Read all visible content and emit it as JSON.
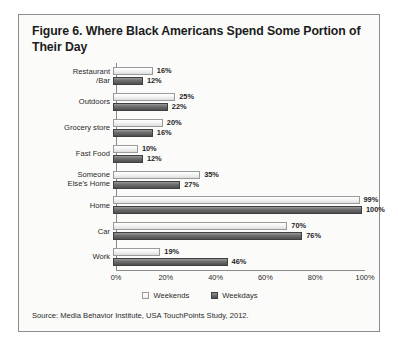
{
  "figure": {
    "title": "Figure 6. Where Black Americans Spend Some Portion of Their Day",
    "source": "Source: Media Behavior Institute, USA TouchPoints Study, 2012."
  },
  "chart_data": {
    "type": "bar",
    "orientation": "horizontal",
    "title": "Figure 6. Where Black Americans Spend Some Portion of Their Day",
    "xlabel": "",
    "ylabel": "",
    "xlim": [
      0,
      100
    ],
    "xticks": [
      "0%",
      "20%",
      "40%",
      "60%",
      "80%",
      "100%"
    ],
    "xtick_values": [
      0,
      20,
      40,
      60,
      80,
      100
    ],
    "grid": false,
    "legend_position": "bottom",
    "categories": [
      "Restaurant\n/Bar",
      "Outdoors",
      "Grocery store",
      "Fast Food",
      "Someone\nElse's Home",
      "Home",
      "Car",
      "Work"
    ],
    "series": [
      {
        "name": "Weekends",
        "color": "#f4f4f4",
        "values": [
          16,
          25,
          20,
          10,
          35,
          99,
          70,
          19
        ],
        "labels": [
          "16%",
          "25%",
          "20%",
          "10%",
          "35%",
          "99%",
          "70%",
          "19%"
        ]
      },
      {
        "name": "Weekdays",
        "color": "#5e5e5e",
        "values": [
          12,
          22,
          16,
          12,
          27,
          100,
          76,
          46
        ],
        "labels": [
          "12%",
          "22%",
          "16%",
          "12%",
          "27%",
          "100%",
          "76%",
          "46%"
        ]
      }
    ]
  }
}
